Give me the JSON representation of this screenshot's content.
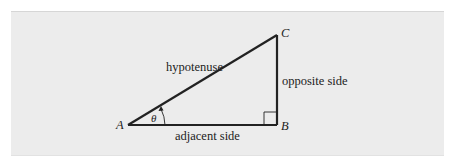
{
  "diagram": {
    "type": "right-triangle",
    "vertices": [
      {
        "name": "A",
        "x": 128,
        "y": 125
      },
      {
        "name": "B",
        "x": 277,
        "y": 125
      },
      {
        "name": "C",
        "x": 277,
        "y": 35
      }
    ],
    "labels": {
      "vertex_a": "A",
      "vertex_b": "B",
      "vertex_c": "C",
      "hypotenuse": "hypotenuse",
      "opposite": "opposite side",
      "adjacent": "adjacent side",
      "angle": "θ"
    },
    "colors": {
      "panel_bg": "#ececec",
      "stroke": "#222222"
    }
  }
}
